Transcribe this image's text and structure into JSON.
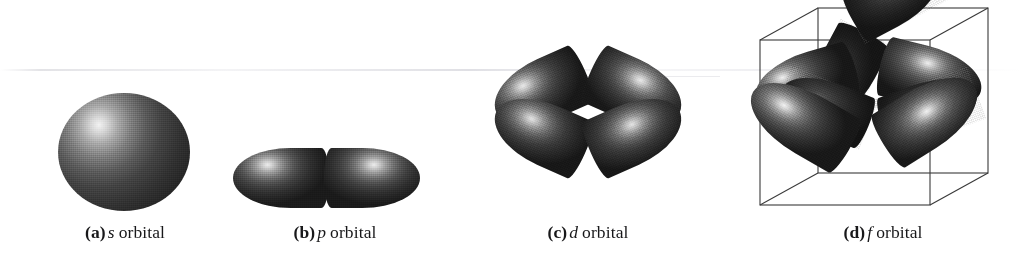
{
  "figure": {
    "background_color": "#ffffff",
    "ink_color": "#1a1a1a",
    "caption_color": "#18181a",
    "panel_count": 4
  },
  "panels": [
    {
      "id": "s-orbital",
      "tag": "(a)",
      "symbol": "s",
      "word": "orbital",
      "shape": "sphere",
      "lobe_count": 1,
      "description": "single shaded sphere with upper-left specular highlight",
      "has_cube": false
    },
    {
      "id": "p-orbital",
      "tag": "(b)",
      "symbol": "p",
      "word": "orbital",
      "shape": "dumbbell",
      "lobe_count": 2,
      "description": "two horizontal teardrop lobes meeting at a central node",
      "has_cube": false
    },
    {
      "id": "d-orbital",
      "tag": "(c)",
      "symbol": "d",
      "word": "orbital",
      "shape": "cloverleaf",
      "lobe_count": 4,
      "description": "four diagonal teardrop lobes meeting at a central node",
      "has_cube": false
    },
    {
      "id": "f-orbital",
      "tag": "(d)",
      "symbol": "f",
      "word": "orbital",
      "shape": "eight-lobed",
      "lobe_count": 8,
      "description": "eight lobes pointing to the corners of a wireframe cube",
      "has_cube": true
    }
  ]
}
